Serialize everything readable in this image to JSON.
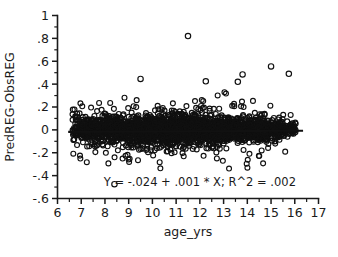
{
  "chart_data": {
    "type": "scatter",
    "title": "",
    "subtitle": "",
    "xlabel": "age_yrs",
    "ylabel": "PredREG-ObsREG",
    "xlim": [
      6,
      17
    ],
    "ylim": [
      -0.6,
      1
    ],
    "grid": false,
    "legend": null,
    "xticks": [
      "6",
      "7",
      "8",
      "9",
      "10",
      "11",
      "12",
      "13",
      "14",
      "15",
      "16",
      "17"
    ],
    "xtick_values": [
      6,
      7,
      8,
      9,
      10,
      11,
      12,
      13,
      14,
      15,
      16,
      17
    ],
    "xminor_step": 0.5,
    "yticks": [
      "1",
      ".8",
      ".6",
      ".4",
      ".2",
      "0",
      "-.2",
      "-.4",
      "-.6"
    ],
    "ytick_values": [
      1,
      0.8,
      0.6,
      0.4,
      0.2,
      0,
      -0.2,
      -0.4,
      -0.6
    ],
    "yminor_step": 0.1,
    "marker": "open-circle",
    "marker_color": "#101010",
    "point_count_label": "",
    "annotation": "Y = -.024 + .001 * X; R^2 = .002",
    "annotation_x": 12.0,
    "annotation_y": -0.46,
    "fit": {
      "type": "linear",
      "intercept": -0.024,
      "slope": 0.001,
      "r_squared": 0.002,
      "x_start": 6.45,
      "x_end": 16.35,
      "equation_text": "Y = -.024 + .001 * X; R^2 = .002"
    },
    "notable_outliers": [
      {
        "x": 11.5,
        "y": 0.82
      },
      {
        "x": 15.0,
        "y": 0.555
      },
      {
        "x": 15.75,
        "y": 0.49
      },
      {
        "x": 13.8,
        "y": 0.485
      },
      {
        "x": 9.5,
        "y": 0.445
      },
      {
        "x": 12.25,
        "y": 0.425
      },
      {
        "x": 13.6,
        "y": 0.42
      },
      {
        "x": 8.4,
        "y": -0.475
      }
    ],
    "series": [
      {
        "name": "residuals",
        "marker": "open-circle",
        "color": "#101010",
        "x": [
          6.45,
          6.62,
          6.66,
          6.7,
          6.72,
          6.74,
          6.76,
          6.78,
          6.8,
          6.82,
          6.84,
          6.86,
          6.88,
          6.9,
          6.92,
          6.94,
          6.96,
          6.98,
          7.0,
          7.02,
          7.04,
          7.06,
          7.08,
          7.1,
          7.12,
          7.14,
          7.16,
          7.18,
          7.2,
          7.22,
          7.24,
          7.26,
          7.28,
          7.3,
          7.32,
          7.34,
          7.36,
          7.38,
          7.4,
          7.42,
          7.44,
          7.46,
          7.48,
          7.5,
          7.52,
          7.54,
          7.56,
          7.58,
          7.6,
          7.62,
          7.64,
          7.66,
          7.68,
          7.7,
          7.72,
          7.74,
          7.76,
          7.78,
          7.8,
          7.82,
          7.84,
          7.86,
          7.88,
          7.9,
          7.92,
          7.94,
          7.96,
          7.98,
          8.0,
          8.02,
          8.04,
          8.06,
          8.08,
          8.1,
          8.12,
          8.14,
          8.16,
          8.18,
          8.2,
          8.22,
          8.24,
          8.26,
          8.28,
          8.3,
          8.32,
          8.34,
          8.36,
          8.38,
          8.4,
          8.42,
          8.44,
          8.46,
          8.48,
          8.5,
          8.52,
          8.54,
          8.56,
          8.58,
          8.6,
          8.62,
          8.64,
          8.66,
          8.68,
          8.7,
          8.72,
          8.74,
          8.76,
          8.78,
          8.8,
          8.82,
          8.84,
          8.86,
          8.88,
          8.9,
          8.92,
          8.94,
          8.96,
          8.98,
          9.0,
          9.02,
          9.04,
          9.06,
          9.08,
          9.1,
          9.12,
          9.14,
          9.16,
          9.18,
          9.2,
          9.22,
          9.24,
          9.26,
          9.28,
          9.3,
          9.32,
          9.34,
          9.36,
          9.38,
          9.4,
          9.42,
          9.44,
          9.46,
          9.48,
          9.5,
          9.52,
          9.54,
          9.56,
          9.58,
          9.6,
          9.62,
          9.64,
          9.66,
          9.68,
          9.7,
          9.72,
          9.74,
          9.76,
          9.78,
          9.8,
          9.82,
          9.84,
          9.86,
          9.88,
          9.9,
          9.92,
          9.94,
          9.96,
          9.98,
          10.0,
          10.02,
          10.04,
          10.06,
          10.08,
          10.1,
          10.12,
          10.14,
          10.16,
          10.18,
          10.2,
          10.22,
          10.24,
          10.26,
          10.28,
          10.3,
          10.32,
          10.34,
          10.36,
          10.38,
          10.4,
          10.42,
          10.44,
          10.46,
          10.48,
          10.5,
          10.52,
          10.54,
          10.56,
          10.58,
          10.6,
          10.62,
          10.64,
          10.66,
          10.68,
          10.7,
          10.72,
          10.74,
          10.76,
          10.78,
          10.8,
          10.82,
          10.84,
          10.86,
          10.88,
          10.9,
          10.92,
          10.94,
          10.96,
          10.98,
          11.0,
          11.02,
          11.04,
          11.06,
          11.08,
          11.1,
          11.12,
          11.14,
          11.16,
          11.18,
          11.2,
          11.22,
          11.24,
          11.26,
          11.28,
          11.3,
          11.32,
          11.34,
          11.36,
          11.38,
          11.4,
          11.42,
          11.44,
          11.46,
          11.48,
          11.5,
          11.52,
          11.54,
          11.56,
          11.58,
          11.6,
          11.62,
          11.64,
          11.66,
          11.68,
          11.7,
          11.72,
          11.74,
          11.76,
          11.78,
          11.8,
          11.82,
          11.84,
          11.86,
          11.88,
          11.9,
          11.92,
          11.94,
          11.96,
          11.98,
          12.0,
          12.02,
          12.04,
          12.06,
          12.08,
          12.1,
          12.12,
          12.14,
          12.16,
          12.18,
          12.2,
          12.22,
          12.24,
          12.26,
          12.28,
          12.3,
          12.32,
          12.34,
          12.36,
          12.38,
          12.4,
          12.42,
          12.44,
          12.46,
          12.48,
          12.5,
          12.52,
          12.54,
          12.56,
          12.58,
          12.6,
          12.62,
          12.64,
          12.66,
          12.68,
          12.7,
          12.72,
          12.74,
          12.76,
          12.78,
          12.8,
          12.82,
          12.84,
          12.86,
          12.88,
          12.9,
          12.92,
          12.94,
          12.96,
          12.98,
          13.0,
          13.02,
          13.04,
          13.06,
          13.08,
          13.1,
          13.12,
          13.14,
          13.16,
          13.18,
          13.2,
          13.22,
          13.24,
          13.26,
          13.28,
          13.3,
          13.32,
          13.34,
          13.36,
          13.38,
          13.4,
          13.42,
          13.44,
          13.46,
          13.48,
          13.5,
          13.52,
          13.54,
          13.56,
          13.58,
          13.6,
          13.62,
          13.64,
          13.66,
          13.68,
          13.7,
          13.72,
          13.74,
          13.76,
          13.78,
          13.8,
          13.82,
          13.84,
          13.86,
          13.88,
          13.9,
          13.92,
          13.94,
          13.96,
          13.98,
          14.0,
          14.02,
          14.04,
          14.06,
          14.08,
          14.1,
          14.12,
          14.14,
          14.16,
          14.18,
          14.2,
          14.22,
          14.24,
          14.26,
          14.28,
          14.3,
          14.32,
          14.34,
          14.36,
          14.38,
          14.4,
          14.42,
          14.44,
          14.46,
          14.48,
          14.5,
          14.52,
          14.54,
          14.56,
          14.58,
          14.6,
          14.62,
          14.64,
          14.66,
          14.68,
          14.7,
          14.72,
          14.74,
          14.76,
          14.78,
          14.8,
          14.82,
          14.84,
          14.86,
          14.88,
          14.9,
          14.92,
          14.94,
          14.96,
          14.98,
          15.0,
          15.05,
          15.1,
          15.15,
          15.2,
          15.25,
          15.3,
          15.35,
          15.4,
          15.45,
          15.5,
          15.55,
          15.6,
          15.65,
          15.7,
          15.75,
          15.8,
          15.85,
          15.9,
          15.95,
          16.0
        ],
        "y_note": "dense residual cloud centered near 0 with spread approx +/-0.2, see generator params"
      }
    ],
    "cloud": {
      "center": 0.0,
      "core_spread": 0.055,
      "tail_spread": 0.14,
      "x_min": 6.62,
      "x_max": 16.05,
      "x_peak": 12.6,
      "n_points": 2600,
      "seed": 20240607
    }
  },
  "axes": {
    "x_axis_label": "age_yrs",
    "y_axis_label": "PredREG-ObsREG"
  }
}
